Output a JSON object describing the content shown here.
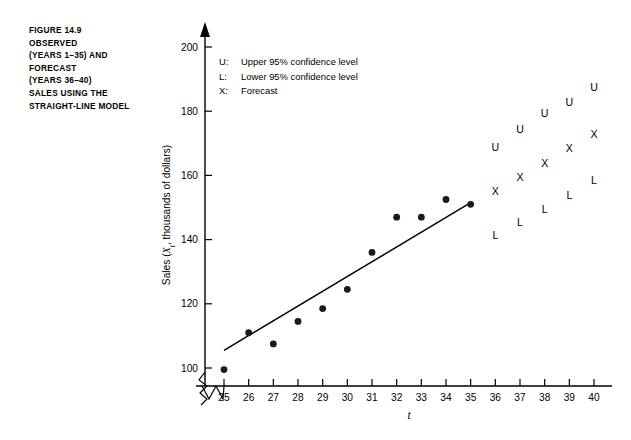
{
  "caption": {
    "lines": [
      "FIGURE 14.9",
      "OBSERVED",
      "(YEARS 1–35) AND",
      "FORECAST",
      "(YEARS 36–40)",
      "SALES USING THE",
      "STRAIGHT-LINE MODEL"
    ]
  },
  "legend": {
    "position": "inside-top-left",
    "items": [
      {
        "key": "U:",
        "label": "Upper 95% confidence level"
      },
      {
        "key": "L:",
        "label": "Lower 95% confidence level"
      },
      {
        "key": "X:",
        "label": "Forecast"
      }
    ]
  },
  "chart_data": {
    "type": "scatter",
    "title": "",
    "subtitle": "",
    "xlabel": "t",
    "ylabel": "Sales (Xt, thousands of dollars)",
    "ylabel_parts": {
      "pre": "Sales (",
      "var": "X",
      "sub": "t",
      "post": ", thousands of dollars)"
    },
    "xlim": [
      25,
      40
    ],
    "ylim": [
      95,
      205
    ],
    "y_axis_break": true,
    "y_axis_break_note": "zigzag break below 100",
    "grid": false,
    "xticks": [
      25,
      26,
      27,
      28,
      29,
      30,
      31,
      32,
      33,
      34,
      35,
      36,
      37,
      38,
      39,
      40
    ],
    "xtick_labels": [
      "25",
      "26",
      "27",
      "28",
      "29",
      "30",
      "31",
      "32",
      "33",
      "34",
      "35",
      "36",
      "37",
      "38",
      "39",
      "40"
    ],
    "yticks": [
      100,
      120,
      140,
      160,
      180,
      200
    ],
    "ytick_labels": [
      "100",
      "120",
      "140",
      "160",
      "180",
      "200"
    ],
    "series": [
      {
        "name": "Observed sales",
        "marker": "filled-circle",
        "x": [
          25,
          26,
          27,
          28,
          29,
          30,
          31,
          32,
          33,
          34,
          35
        ],
        "values": [
          99.5,
          111.0,
          107.5,
          114.5,
          118.5,
          124.5,
          136.0,
          147.0,
          147.0,
          152.5,
          151.0
        ]
      },
      {
        "name": "Forecast",
        "marker": "X",
        "x": [
          36,
          37,
          38,
          39,
          40
        ],
        "values": [
          155.0,
          159.5,
          164.0,
          168.5,
          173.0
        ]
      },
      {
        "name": "Upper 95% confidence level",
        "marker": "U",
        "x": [
          36,
          37,
          38,
          39,
          40
        ],
        "values": [
          169.0,
          174.5,
          179.5,
          183.0,
          187.5
        ]
      },
      {
        "name": "Lower 95% confidence level",
        "marker": "L",
        "x": [
          36,
          37,
          38,
          39,
          40
        ],
        "values": [
          141.5,
          145.5,
          149.5,
          154.0,
          158.5
        ]
      }
    ],
    "fit_line": {
      "name": "Straight-line (least squares) fit",
      "x": [
        25,
        35
      ],
      "y": [
        105.5,
        151.5
      ]
    }
  },
  "colors": {
    "background": "#ffffff",
    "ink": "#000000",
    "marker": "#1a1a1a"
  }
}
